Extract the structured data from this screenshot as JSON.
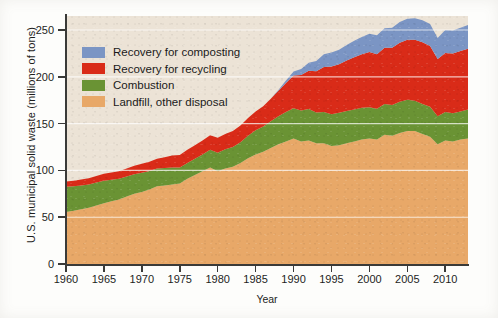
{
  "chart_data": {
    "type": "area",
    "stacked": true,
    "title": "",
    "xlabel": "Year",
    "ylabel": "U.S. municipal solid waste (millions of tons)",
    "xlim": [
      1960,
      2013
    ],
    "ylim": [
      0,
      265
    ],
    "ytick_values": [
      0,
      50,
      100,
      150,
      200,
      250
    ],
    "ytick_labels": [
      "0",
      "50",
      "100",
      "150",
      "200",
      "250"
    ],
    "xtick_values": [
      1960,
      1965,
      1970,
      1975,
      1980,
      1985,
      1990,
      1995,
      2000,
      2005,
      2010
    ],
    "xtick_labels": [
      "1960",
      "1965",
      "1970",
      "1975",
      "1980",
      "1985",
      "1990",
      "1995",
      "2000",
      "2005",
      "2010"
    ],
    "grid": "horizontal-white-faint",
    "legend_position": "upper-left-inside",
    "plot_background": "#ece3d6",
    "x": [
      1960,
      1961,
      1962,
      1963,
      1964,
      1965,
      1966,
      1967,
      1968,
      1969,
      1970,
      1971,
      1972,
      1973,
      1974,
      1975,
      1976,
      1977,
      1978,
      1979,
      1980,
      1981,
      1982,
      1983,
      1984,
      1985,
      1986,
      1987,
      1988,
      1989,
      1990,
      1991,
      1992,
      1993,
      1994,
      1995,
      1996,
      1997,
      1998,
      1999,
      2000,
      2001,
      2002,
      2003,
      2004,
      2005,
      2006,
      2007,
      2008,
      2009,
      2010,
      2011,
      2012,
      2013
    ],
    "series": [
      {
        "name": "Landfill, other disposal",
        "color": "#e8a868",
        "values": [
          55.5,
          57.0,
          58.5,
          60.0,
          62.5,
          65.0,
          67.0,
          69.0,
          72.0,
          75.0,
          77.0,
          79.5,
          83.0,
          84.0,
          85.0,
          86.0,
          91.0,
          95.0,
          99.0,
          103.0,
          99.0,
          102.0,
          104.0,
          108.0,
          113.0,
          117.0,
          120.0,
          124.0,
          128.0,
          131.0,
          134.0,
          131.0,
          132.0,
          129.0,
          129.0,
          126.0,
          127.0,
          129.0,
          131.0,
          133.0,
          134.0,
          133.0,
          138.0,
          137.0,
          140.0,
          142.0,
          142.0,
          139.0,
          136.0,
          128.0,
          132.0,
          131.0,
          133.0,
          134.0
        ]
      },
      {
        "name": "Combustion",
        "color": "#6a9334",
        "values": [
          27.0,
          26.0,
          25.5,
          25.0,
          24.5,
          24.0,
          23.0,
          22.0,
          21.5,
          21.0,
          20.5,
          20.0,
          19.0,
          18.5,
          18.0,
          17.0,
          17.0,
          17.5,
          18.0,
          19.0,
          20.0,
          20.5,
          21.0,
          22.0,
          24.0,
          26.0,
          27.0,
          28.5,
          30.0,
          31.5,
          32.5,
          33.0,
          33.5,
          33.0,
          33.5,
          34.0,
          34.5,
          34.5,
          34.0,
          34.0,
          33.5,
          33.0,
          33.0,
          33.0,
          33.5,
          33.5,
          32.5,
          32.0,
          32.0,
          30.0,
          30.5,
          30.0,
          30.0,
          31.0
        ]
      },
      {
        "name": "Recovery for recycling",
        "color": "#d92b18",
        "values": [
          5.6,
          6.0,
          6.2,
          6.5,
          7.0,
          7.5,
          7.8,
          8.0,
          8.5,
          9.0,
          9.5,
          9.8,
          10.5,
          11.5,
          13.0,
          13.5,
          14.0,
          14.5,
          15.0,
          15.5,
          16.0,
          16.5,
          17.0,
          18.0,
          19.0,
          20.0,
          21.5,
          24.0,
          27.0,
          31.0,
          35.0,
          38.0,
          41.0,
          44.0,
          48.0,
          51.0,
          52.0,
          54.0,
          56.0,
          57.0,
          59.0,
          58.0,
          60.0,
          61.0,
          63.0,
          64.0,
          65.0,
          66.0,
          65.0,
          61.0,
          63.0,
          64.0,
          64.5,
          65.0
        ]
      },
      {
        "name": "Recovery for composting",
        "color": "#7b95c4",
        "values": [
          0,
          0,
          0,
          0,
          0,
          0,
          0,
          0,
          0,
          0,
          0,
          0,
          0,
          0,
          0,
          0,
          0,
          0,
          0,
          0,
          0,
          0,
          0,
          0,
          0,
          0,
          0,
          0,
          1.0,
          2.5,
          4.2,
          6.5,
          8.5,
          11.0,
          13.5,
          15.0,
          15.5,
          16.5,
          17.5,
          18.5,
          19.5,
          20.5,
          21.0,
          21.5,
          22.0,
          22.5,
          23.0,
          23.5,
          23.5,
          22.5,
          24.5,
          24.5,
          25.0,
          25.5
        ]
      }
    ],
    "totals": [
      88.1,
      89.0,
      90.2,
      91.5,
      94.0,
      96.5,
      97.8,
      99.0,
      102.0,
      105.0,
      107.0,
      109.3,
      112.5,
      114.0,
      116.0,
      116.5,
      122.0,
      127.0,
      132.0,
      137.5,
      135.0,
      139.0,
      142.0,
      148.0,
      156.0,
      163.0,
      168.5,
      176.5,
      186.0,
      196.0,
      205.7,
      208.5,
      215.0,
      217.0,
      224.0,
      226.0,
      229.0,
      234.0,
      238.5,
      242.5,
      246.0,
      244.5,
      252.0,
      252.5,
      258.5,
      262.0,
      262.5,
      260.5,
      256.5,
      241.5,
      250.0,
      249.5,
      252.5,
      255.5
    ]
  },
  "legend": {
    "items": [
      {
        "label": "Recovery for composting",
        "color": "#7b95c4"
      },
      {
        "label": "Recovery for recycling",
        "color": "#d92b18"
      },
      {
        "label": "Combustion",
        "color": "#6a9334"
      },
      {
        "label": "Landfill, other disposal",
        "color": "#e8a868"
      }
    ]
  }
}
